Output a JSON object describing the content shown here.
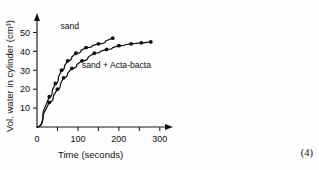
{
  "marks_text": "(4)",
  "chart_data": {
    "type": "line",
    "title": "",
    "xlabel": "Time (seconds)",
    "ylabel": "Vol. water in cylinder (cm³)",
    "xlim": [
      0,
      320
    ],
    "ylim": [
      0,
      55
    ],
    "xticks": [
      0,
      100,
      200,
      300
    ],
    "xtick_labels": [
      "0",
      "100",
      "200",
      "300"
    ],
    "xminor_ticks": [
      50,
      150,
      250
    ],
    "yticks": [
      10,
      20,
      30,
      40,
      50
    ],
    "ytick_labels": [
      "10",
      "20",
      "30",
      "40",
      "50"
    ],
    "grid": false,
    "legend": "inline-labels",
    "series": [
      {
        "name": "sand",
        "label": "sand",
        "label_x": 80,
        "label_y": 52,
        "x": [
          0,
          30,
          45,
          60,
          75,
          95,
          120,
          150,
          185
        ],
        "y": [
          0,
          16,
          23,
          30,
          35,
          39,
          42,
          44,
          47
        ]
      },
      {
        "name": "sand + Acta-bacta",
        "label": "sand + Acta-bacta",
        "label_x": 110,
        "label_y": 31,
        "x": [
          0,
          30,
          50,
          65,
          85,
          110,
          140,
          170,
          200,
          230,
          255,
          278
        ],
        "y": [
          0,
          13,
          20,
          26,
          31,
          35,
          39,
          41,
          43,
          44,
          44.5,
          45
        ]
      }
    ]
  }
}
